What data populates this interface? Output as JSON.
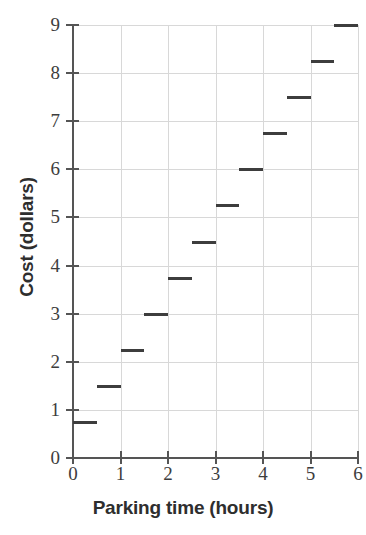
{
  "chart_data": {
    "type": "line",
    "subtype": "step",
    "title": "",
    "xlabel": "Parking time (hours)",
    "ylabel": "Cost (dollars)",
    "xlim": [
      0,
      6
    ],
    "ylim": [
      0,
      9
    ],
    "xticks": [
      0,
      1,
      2,
      3,
      4,
      5,
      6
    ],
    "yticks": [
      0,
      1,
      2,
      3,
      4,
      5,
      6,
      7,
      8,
      9
    ],
    "xtick_labels": [
      "0",
      "1",
      "2",
      "3",
      "4",
      "5",
      "6"
    ],
    "ytick_labels": [
      "0",
      "1",
      "2",
      "3",
      "4",
      "5",
      "6",
      "7",
      "8",
      "9"
    ],
    "grid": true,
    "legend": null,
    "series": [
      {
        "name": "Parking cost",
        "color": "#3d3d3d",
        "steps": [
          {
            "x_start": 0.0,
            "x_end": 0.5,
            "y": 0.75
          },
          {
            "x_start": 0.5,
            "x_end": 1.0,
            "y": 1.5
          },
          {
            "x_start": 1.0,
            "x_end": 1.5,
            "y": 2.25
          },
          {
            "x_start": 1.5,
            "x_end": 2.0,
            "y": 3.0
          },
          {
            "x_start": 2.0,
            "x_end": 2.5,
            "y": 3.75
          },
          {
            "x_start": 2.5,
            "x_end": 3.0,
            "y": 4.5
          },
          {
            "x_start": 3.0,
            "x_end": 3.5,
            "y": 5.25
          },
          {
            "x_start": 3.5,
            "x_end": 4.0,
            "y": 6.0
          },
          {
            "x_start": 4.0,
            "x_end": 4.5,
            "y": 6.75
          },
          {
            "x_start": 4.5,
            "x_end": 5.0,
            "y": 7.5
          },
          {
            "x_start": 5.0,
            "x_end": 5.5,
            "y": 8.25
          },
          {
            "x_start": 5.5,
            "x_end": 6.0,
            "y": 9.0
          }
        ]
      }
    ],
    "colors": {
      "data": "#3d3d3d",
      "axis": "#555555",
      "grid": "#d8d8d8",
      "background": "#ffffff",
      "text": "#2e2e2e"
    }
  }
}
